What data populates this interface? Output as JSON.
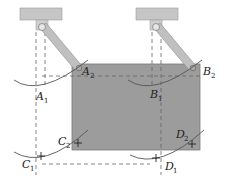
{
  "diagram": {
    "type": "mechanism",
    "colors": {
      "plate": "#9a9a9a",
      "plate_edge": "#7a7a7a",
      "link": "#bdbdbd",
      "link_edge": "#8c8c8c",
      "support": "#c4c4c4",
      "arc": "#555555",
      "dashed": "#666666"
    },
    "labels": {
      "A1": {
        "base": "A",
        "sub": "1"
      },
      "A2": {
        "base": "A",
        "sub": "2"
      },
      "B1": {
        "base": "B",
        "sub": "1"
      },
      "B2": {
        "base": "B",
        "sub": "2"
      },
      "C1": {
        "base": "C",
        "sub": "1"
      },
      "C2": {
        "base": "C",
        "sub": "2"
      },
      "D1": {
        "base": "D",
        "sub": "1"
      },
      "D2": {
        "base": "D",
        "sub": "2"
      }
    }
  }
}
